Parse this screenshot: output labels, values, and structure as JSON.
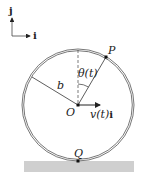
{
  "diagram": {
    "axes": {
      "j_label": "j",
      "i_label": "i"
    },
    "labels": {
      "P": "P",
      "O": "O",
      "Q": "Q",
      "b": "b",
      "theta": "θ(t)",
      "velocity_v": "v(t)",
      "velocity_i": "i"
    },
    "geometry": {
      "circle_center": [
        78,
        105
      ],
      "circle_radius": 55,
      "ground": {
        "x": 24,
        "y": 161,
        "width": 110,
        "height": 11
      }
    },
    "colors": {
      "line": "#333333",
      "ground": "#cfcfcf",
      "background": "#ffffff"
    }
  }
}
